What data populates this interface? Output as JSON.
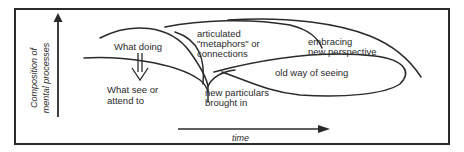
{
  "diagram": {
    "axes": {
      "y_label_line1": "Composition of",
      "y_label_line2": "mental processes",
      "x_label": "time"
    },
    "labels": {
      "what_doing": "What doing",
      "what_see_line1": "What see or",
      "what_see_line2": "attend to",
      "articulated_line1": "articulated",
      "articulated_line2": "\"metaphors\"  or",
      "articulated_line3": "connections",
      "embracing_line1": "embracing",
      "embracing_line2": "new perspective",
      "old_way": "old way of seeing",
      "new_particulars_line1": "new particulars",
      "new_particulars_line2": "brought in"
    },
    "colors": {
      "stroke": "#2a2a2a",
      "background": "#ffffff"
    }
  }
}
